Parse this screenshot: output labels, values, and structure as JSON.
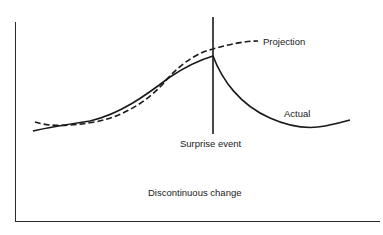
{
  "diagram": {
    "title": "Discontinuous change",
    "event_label": "Surprise event",
    "series": [
      {
        "name": "Projection",
        "style": "dashed",
        "color": "#1a1a1a"
      },
      {
        "name": "Actual",
        "style": "solid",
        "color": "#1a1a1a"
      }
    ],
    "labels": {
      "projection": "Projection",
      "actual": "Actual",
      "surprise_event": "Surprise event",
      "caption": "Discontinuous change"
    },
    "colors": {
      "ink": "#1a1a1a",
      "background": "#ffffff"
    }
  }
}
